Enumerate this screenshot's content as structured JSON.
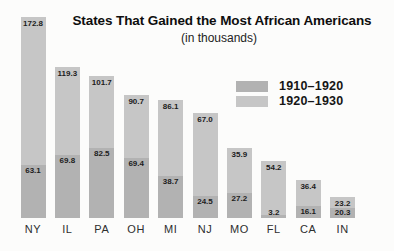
{
  "page": {
    "background": "#fcfcfb"
  },
  "header": {
    "title": "States That Gained the Most African Americans",
    "subtitle": "(in thousands)"
  },
  "legend": {
    "position": "upper-right",
    "items": [
      {
        "label": "1910–1920",
        "color": "#b2b2b2"
      },
      {
        "label": "1920–1930",
        "color": "#c6c6c6"
      }
    ]
  },
  "chart_data": {
    "type": "bar",
    "variant": "stacked-vertical",
    "title": "States That Gained the Most African Americans",
    "subtitle": "(in thousands)",
    "categories": [
      "NY",
      "IL",
      "PA",
      "OH",
      "MI",
      "NJ",
      "MO",
      "FL",
      "CA",
      "IN"
    ],
    "series": [
      {
        "name": "1910–1920",
        "position": "bottom",
        "color": "#b2b2b2",
        "values": [
          63.1,
          69.8,
          82.5,
          69.4,
          38.7,
          24.5,
          27.2,
          3.2,
          16.1,
          20.3
        ]
      },
      {
        "name": "1920–1930",
        "position": "top",
        "color": "#c6c6c6",
        "values": [
          172.8,
          119.3,
          101.7,
          90.7,
          86.1,
          67.0,
          35.9,
          54.2,
          36.4,
          23.2
        ]
      }
    ],
    "value_labels": "one-decimal, inside segment top",
    "axes": "none (no gridlines, no y-axis; category labels under bars)",
    "layout_px": {
      "baseline_y": 218,
      "bar_width": 25,
      "centers": [
        33,
        67.4,
        101.8,
        136.2,
        170.6,
        205,
        239.4,
        273.8,
        308.2,
        342.6
      ],
      "bar_top_y": [
        17,
        67,
        76,
        95,
        100,
        113,
        148,
        161,
        180,
        197
      ],
      "split_y": [
        165,
        155,
        148,
        158,
        176,
        196,
        193,
        215,
        206,
        208
      ],
      "state_label_y": 224
    }
  }
}
